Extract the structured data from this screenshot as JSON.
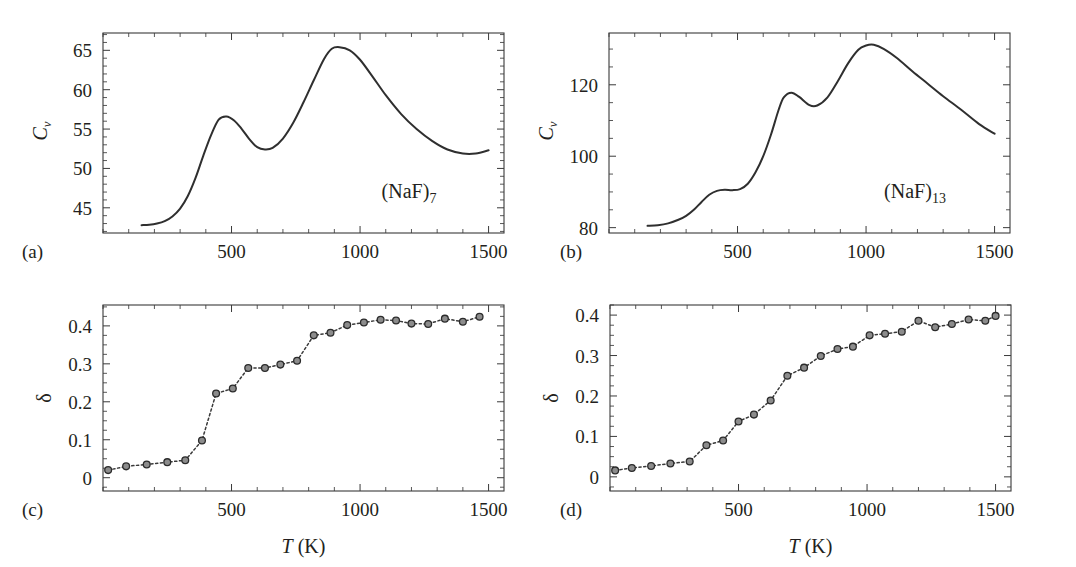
{
  "figure": {
    "caption_letters": [
      "(a)",
      "(b)",
      "(c)",
      "(d)"
    ],
    "background": "#ffffff",
    "ink": "#231f20",
    "curve_color": "#2f2f2f",
    "marker_fill": "#8c8c8c",
    "marker_edge": "#2b2b2b"
  },
  "chart_data": [
    {
      "panel": "a",
      "letter": "(a)",
      "type": "line",
      "title": "",
      "annotation": "(NaF)7",
      "annotation_base": "(NaF)",
      "annotation_sub": "7",
      "xlabel": "",
      "ylabel": "Cv",
      "ylabel_base": "C",
      "ylabel_sub": "v",
      "xlim": [
        0,
        1560
      ],
      "ylim": [
        41.8,
        67.2
      ],
      "xticks": [
        500,
        1000,
        1500
      ],
      "xticklabels": [
        "500",
        "1000",
        "1500"
      ],
      "xtick_minor_step": 100,
      "yticks": [
        45,
        50,
        55,
        60,
        65
      ],
      "yticklabels": [
        "45",
        "50",
        "55",
        "60",
        "65"
      ],
      "ytick_minor_step": 1,
      "grid": false,
      "legend": "none",
      "x": [
        150,
        180,
        210,
        240,
        270,
        300,
        330,
        360,
        390,
        420,
        450,
        480,
        510,
        540,
        570,
        600,
        630,
        660,
        700,
        740,
        780,
        820,
        860,
        890,
        920,
        960,
        1000,
        1050,
        1100,
        1160,
        1220,
        1280,
        1340,
        1400,
        1450,
        1500
      ],
      "y": [
        42.8,
        42.85,
        43.0,
        43.3,
        43.9,
        44.9,
        46.5,
        48.8,
        51.6,
        54.2,
        56.2,
        56.6,
        56.1,
        55.0,
        53.7,
        52.7,
        52.4,
        52.6,
        53.8,
        55.8,
        58.4,
        61.2,
        63.9,
        65.2,
        65.4,
        65.0,
        63.8,
        61.6,
        59.3,
        56.9,
        55.0,
        53.5,
        52.4,
        51.9,
        51.9,
        52.3
      ]
    },
    {
      "panel": "b",
      "letter": "(b)",
      "type": "line",
      "title": "",
      "annotation": "(NaF)13",
      "annotation_base": "(NaF)",
      "annotation_sub": "13",
      "xlabel": "",
      "ylabel": "Cv",
      "ylabel_base": "C",
      "ylabel_sub": "v",
      "xlim": [
        0,
        1560
      ],
      "ylim": [
        78.5,
        134.5
      ],
      "xticks": [
        500,
        1000,
        1500
      ],
      "xticklabels": [
        "500",
        "1000",
        "1500"
      ],
      "xtick_minor_step": 100,
      "yticks": [
        80,
        100,
        120
      ],
      "yticklabels": [
        "80",
        "100",
        "120"
      ],
      "ytick_minor_step": 5,
      "grid": false,
      "legend": "none",
      "x": [
        150,
        190,
        230,
        270,
        300,
        330,
        360,
        390,
        420,
        450,
        480,
        510,
        540,
        570,
        600,
        630,
        660,
        680,
        710,
        740,
        780,
        810,
        850,
        890,
        930,
        970,
        1000,
        1030,
        1070,
        1120,
        1180,
        1240,
        1300,
        1370,
        1440,
        1500
      ],
      "y": [
        80.5,
        80.7,
        81.2,
        82.2,
        83.3,
        85.0,
        87.2,
        89.2,
        90.3,
        90.6,
        90.5,
        90.8,
        92.3,
        95.5,
        100.0,
        106.0,
        113.0,
        116.5,
        117.8,
        116.6,
        114.3,
        114.2,
        116.5,
        121.0,
        126.0,
        129.8,
        131.0,
        131.2,
        130.0,
        127.5,
        123.8,
        120.3,
        116.8,
        113.0,
        109.0,
        106.3
      ]
    },
    {
      "panel": "c",
      "letter": "(c)",
      "type": "scatter",
      "title": "",
      "annotation": "",
      "xlabel": "T (K)",
      "xlabel_italic": "T",
      "xlabel_rest": " (K)",
      "ylabel": "δ",
      "xlim": [
        0,
        1560
      ],
      "ylim": [
        -0.035,
        0.455
      ],
      "xticks": [
        500,
        1000,
        1500
      ],
      "xticklabels": [
        "500",
        "1000",
        "1500"
      ],
      "xtick_minor_step": 100,
      "yticks": [
        0,
        0.1,
        0.2,
        0.3,
        0.4
      ],
      "yticklabels": [
        "0",
        "0.1",
        "0.2",
        "0.3",
        "0.4"
      ],
      "ytick_minor_step": 0.025,
      "grid": false,
      "legend": "none",
      "linestyle": "dotted",
      "marker": "circle",
      "x": [
        20,
        90,
        170,
        250,
        320,
        385,
        440,
        505,
        565,
        630,
        690,
        755,
        820,
        885,
        950,
        1015,
        1080,
        1140,
        1200,
        1265,
        1330,
        1400,
        1465
      ],
      "y": [
        0.02,
        0.03,
        0.035,
        0.041,
        0.046,
        0.098,
        0.222,
        0.235,
        0.289,
        0.289,
        0.298,
        0.308,
        0.375,
        0.382,
        0.402,
        0.409,
        0.416,
        0.414,
        0.406,
        0.405,
        0.419,
        0.411,
        0.424
      ]
    },
    {
      "panel": "d",
      "letter": "(d)",
      "type": "scatter",
      "title": "",
      "annotation": "",
      "xlabel": "T (K)",
      "xlabel_italic": "T",
      "xlabel_rest": " (K)",
      "ylabel": "δ",
      "xlim": [
        0,
        1560
      ],
      "ylim": [
        -0.035,
        0.425
      ],
      "xticks": [
        500,
        1000,
        1500
      ],
      "xticklabels": [
        "500",
        "1000",
        "1500"
      ],
      "xtick_minor_step": 100,
      "yticks": [
        0,
        0.1,
        0.2,
        0.3,
        0.4
      ],
      "yticklabels": [
        "0",
        "0.1",
        "0.2",
        "0.3",
        "0.4"
      ],
      "ytick_minor_step": 0.025,
      "grid": false,
      "legend": "none",
      "linestyle": "dotted",
      "marker": "circle",
      "x": [
        20,
        85,
        160,
        235,
        310,
        375,
        440,
        500,
        560,
        625,
        690,
        755,
        820,
        885,
        945,
        1010,
        1070,
        1135,
        1200,
        1265,
        1330,
        1395,
        1460,
        1500
      ],
      "y": [
        0.016,
        0.022,
        0.027,
        0.033,
        0.038,
        0.078,
        0.09,
        0.137,
        0.154,
        0.189,
        0.25,
        0.27,
        0.299,
        0.316,
        0.322,
        0.35,
        0.354,
        0.359,
        0.386,
        0.37,
        0.378,
        0.389,
        0.386,
        0.398
      ]
    }
  ]
}
